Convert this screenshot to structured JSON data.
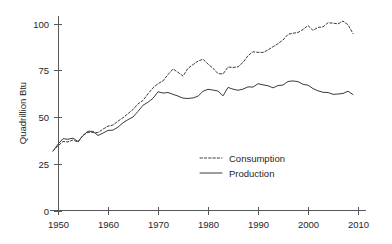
{
  "chart_data": {
    "type": "line",
    "title": "",
    "subtitle": "",
    "xlabel": "",
    "ylabel": "Quadrillion Btu",
    "xlim": [
      1949,
      2009
    ],
    "ylim": [
      0,
      105
    ],
    "grid": false,
    "legend_position": "inside-center-lower",
    "x_ticks": [
      1950,
      1960,
      1970,
      1980,
      1990,
      2000,
      2010
    ],
    "x_tick_labels": [
      "1950",
      "1960",
      "1970",
      "1980",
      "1990",
      "2000",
      "2010"
    ],
    "y_ticks": [
      0,
      25,
      50,
      75,
      100
    ],
    "y_tick_labels": [
      "0",
      "25",
      "50",
      "75",
      "100"
    ],
    "x": [
      1949,
      1950,
      1951,
      1952,
      1953,
      1954,
      1955,
      1956,
      1957,
      1958,
      1959,
      1960,
      1961,
      1962,
      1963,
      1964,
      1965,
      1966,
      1967,
      1968,
      1969,
      1970,
      1971,
      1972,
      1973,
      1974,
      1975,
      1976,
      1977,
      1978,
      1979,
      1980,
      1981,
      1982,
      1983,
      1984,
      1985,
      1986,
      1987,
      1988,
      1989,
      1990,
      1991,
      1992,
      1993,
      1994,
      1995,
      1996,
      1997,
      1998,
      1999,
      2000,
      2001,
      2002,
      2003,
      2004,
      2005,
      2006,
      2007,
      2008,
      2009
    ],
    "series": [
      {
        "name": "Consumption",
        "style": "dashed",
        "color": "#3c3c3c",
        "values": [
          31.9,
          34.6,
          36.9,
          36.7,
          37.7,
          36.6,
          40.2,
          41.8,
          41.8,
          41.6,
          43.5,
          45.1,
          45.7,
          47.8,
          49.6,
          51.8,
          54.0,
          57.0,
          58.9,
          62.4,
          65.6,
          67.8,
          69.3,
          72.7,
          75.7,
          73.9,
          71.9,
          76.0,
          78.0,
          79.9,
          80.9,
          78.3,
          76.1,
          73.2,
          73.0,
          76.7,
          76.5,
          76.8,
          79.2,
          82.8,
          84.9,
          84.6,
          84.5,
          85.9,
          87.6,
          89.2,
          91.2,
          94.2,
          94.8,
          95.2,
          96.8,
          98.9,
          96.3,
          97.9,
          98.2,
          100.4,
          100.2,
          99.8,
          101.3,
          99.3,
          94.6
        ]
      },
      {
        "name": "Production",
        "style": "solid",
        "color": "#3c3c3c",
        "values": [
          31.7,
          35.5,
          38.4,
          38.1,
          38.7,
          36.9,
          40.1,
          42.4,
          42.3,
          40.1,
          41.4,
          42.8,
          43.0,
          44.6,
          46.9,
          48.6,
          50.0,
          53.0,
          56.3,
          57.9,
          60.0,
          63.5,
          62.8,
          63.1,
          62.1,
          61.2,
          60.1,
          59.9,
          60.2,
          61.1,
          63.8,
          64.8,
          64.4,
          63.9,
          61.3,
          65.8,
          64.9,
          64.3,
          64.9,
          66.1,
          66.0,
          67.8,
          67.2,
          66.7,
          65.6,
          66.8,
          67.1,
          69.0,
          69.3,
          68.9,
          67.5,
          67.0,
          65.2,
          64.0,
          63.2,
          63.1,
          62.1,
          62.3,
          62.6,
          63.8,
          62.0
        ]
      }
    ]
  },
  "axes": {
    "y_axis_title": "Quadrillion Btu"
  },
  "legend": {
    "entries": [
      {
        "label": "Consumption",
        "style": "dashed"
      },
      {
        "label": "Production",
        "style": "solid"
      }
    ]
  },
  "colors": {
    "background": "#ffffff",
    "axis": "#585858",
    "line": "#3c3c3c",
    "text": "#262626"
  }
}
